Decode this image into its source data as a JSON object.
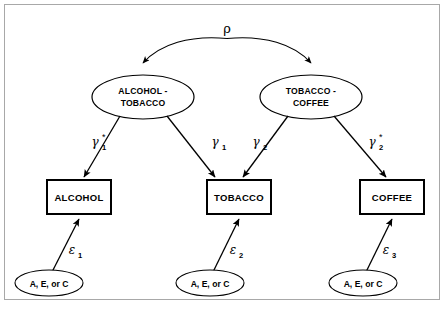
{
  "figure": {
    "type": "path-diagram",
    "correlation": {
      "symbol": "ρ",
      "name": "rho",
      "between": [
        "ALCOHOL - TOBACCO",
        "TOBACCO - COFFEE"
      ]
    },
    "latent_variables": [
      {
        "id": "alcohol-tobacco",
        "line1": "ALCOHOL -",
        "line2": "TOBACCO"
      },
      {
        "id": "tobacco-coffee",
        "line1": "TOBACCO -",
        "line2": "COFFEE"
      }
    ],
    "observed_variables": [
      {
        "id": "alcohol",
        "label": "ALCOHOL"
      },
      {
        "id": "tobacco",
        "label": "TOBACCO"
      },
      {
        "id": "coffee",
        "label": "COFFEE"
      }
    ],
    "residual_sources": [
      {
        "id": "source-1",
        "label": "A, E, or C"
      },
      {
        "id": "source-2",
        "label": "A, E, or C"
      },
      {
        "id": "source-3",
        "label": "A, E, or C"
      }
    ],
    "path_coefficients": [
      {
        "id": "gamma-1-star",
        "base": "γ",
        "subscript": "1",
        "star": "*",
        "from": "alcohol-tobacco",
        "to": "alcohol"
      },
      {
        "id": "gamma-1",
        "base": "γ",
        "subscript": "1",
        "star": "",
        "from": "alcohol-tobacco",
        "to": "tobacco"
      },
      {
        "id": "gamma-2",
        "base": "γ",
        "subscript": "2",
        "star": "",
        "from": "tobacco-coffee",
        "to": "tobacco"
      },
      {
        "id": "gamma-2-star",
        "base": "γ",
        "subscript": "2",
        "star": "*",
        "from": "tobacco-coffee",
        "to": "coffee"
      }
    ],
    "residual_coefficients": [
      {
        "id": "epsilon-1",
        "base": "ε",
        "subscript": "1",
        "from": "source-1",
        "to": "alcohol"
      },
      {
        "id": "epsilon-2",
        "base": "ε",
        "subscript": "2",
        "from": "source-2",
        "to": "tobacco"
      },
      {
        "id": "epsilon-3",
        "base": "ε",
        "subscript": "3",
        "from": "source-3",
        "to": "coffee"
      }
    ],
    "colors": {
      "stroke": "#000000",
      "fill": "#ffffff",
      "frame": "#a8a8a8"
    }
  }
}
